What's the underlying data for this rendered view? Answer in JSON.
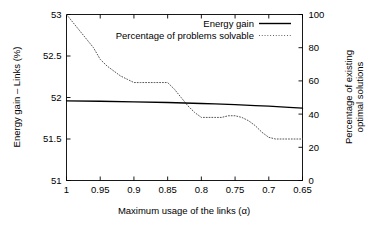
{
  "chart_data": {
    "type": "line",
    "title": "",
    "xlabel": "Maximum usage of the links (α)",
    "ylabel": "Energy gain – Links (%)",
    "y2label_line1": "Percentage of existing",
    "y2label_line2": "optimal solutions",
    "grid": false,
    "legend_position": "top-right",
    "x_axis": {
      "ticks": [
        1,
        0.95,
        0.9,
        0.85,
        0.8,
        0.75,
        0.7,
        0.65
      ],
      "tick_labels": [
        "1",
        "0.95",
        "0.9",
        "0.85",
        "0.8",
        "0.75",
        "0.7",
        "0.65"
      ],
      "xlim": [
        1.0,
        0.65
      ],
      "direction": "descending"
    },
    "y_axis_left": {
      "ticks": [
        51,
        51.5,
        52,
        52.5,
        53
      ],
      "tick_labels": [
        "51",
        "51.5",
        "52",
        "52.5",
        "53"
      ],
      "ylim": [
        51,
        53
      ]
    },
    "y_axis_right": {
      "ticks": [
        0,
        20,
        40,
        60,
        80,
        100
      ],
      "tick_labels": [
        "0",
        "20",
        "40",
        "60",
        "80",
        "100"
      ],
      "ylim": [
        0,
        100
      ]
    },
    "series": [
      {
        "name": "Energy gain",
        "style": "solid",
        "axis": "left",
        "color": "#000000",
        "x": [
          1.0,
          0.95,
          0.9,
          0.85,
          0.8,
          0.78,
          0.75,
          0.72,
          0.7,
          0.67,
          0.65
        ],
        "values": [
          51.96,
          51.955,
          51.948,
          51.94,
          51.928,
          51.923,
          51.913,
          51.903,
          51.896,
          51.882,
          51.872
        ]
      },
      {
        "name": "Percentage of problems solvable",
        "style": "dotted",
        "axis": "right",
        "color": "#555555",
        "x": [
          1.0,
          0.99,
          0.98,
          0.97,
          0.96,
          0.95,
          0.94,
          0.93,
          0.92,
          0.91,
          0.9,
          0.89,
          0.88,
          0.87,
          0.86,
          0.85,
          0.84,
          0.83,
          0.82,
          0.81,
          0.8,
          0.79,
          0.78,
          0.77,
          0.76,
          0.75,
          0.74,
          0.73,
          0.72,
          0.71,
          0.7,
          0.69,
          0.68,
          0.67,
          0.66,
          0.65
        ],
        "values": [
          100,
          95,
          90,
          85,
          80,
          73,
          69,
          66,
          63,
          61,
          59,
          59,
          59,
          59,
          59,
          59,
          55,
          50,
          45,
          41,
          38,
          38,
          38,
          38,
          39,
          39,
          38,
          36,
          33,
          29,
          26,
          25,
          25,
          25,
          25,
          25
        ]
      }
    ],
    "legend": [
      {
        "label": "Energy gain",
        "style": "solid"
      },
      {
        "label": "Percentage of problems solvable",
        "style": "dotted"
      }
    ]
  }
}
